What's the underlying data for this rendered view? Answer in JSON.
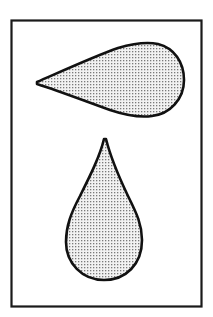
{
  "figure": {
    "title": "",
    "background": "#ffffff",
    "frame": {
      "stroke": "#1a1a1a",
      "fill": "#ffffff"
    },
    "shapes": [
      {
        "name": "horizontal-teardrop",
        "orientation": "pointing-left",
        "fill": "stippled-gray",
        "stroke": "#111111"
      },
      {
        "name": "vertical-teardrop",
        "orientation": "pointing-up",
        "fill": "stippled-gray",
        "stroke": "#111111"
      }
    ],
    "colors": {
      "stipple_dot": "#7a7a7a",
      "stipple_bg": "#f2f2f2",
      "outline": "#111111"
    }
  }
}
